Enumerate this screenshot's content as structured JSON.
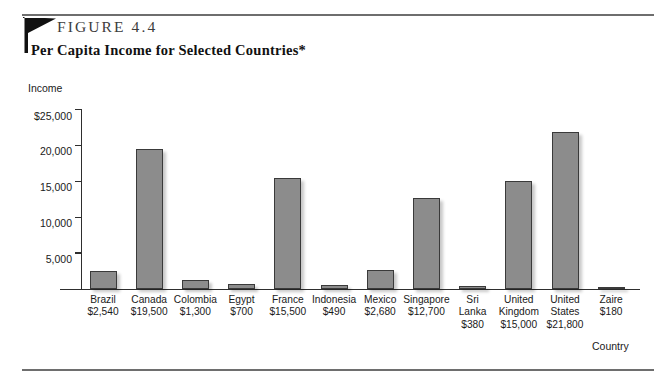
{
  "figure": {
    "label": "FIGURE 4.4",
    "title": "Per Capita Income for Selected Countries*"
  },
  "chart_data": {
    "type": "bar",
    "title": "Per Capita Income for Selected Countries*",
    "xlabel": "Country",
    "ylabel": "Income",
    "ylim": [
      0,
      25000
    ],
    "yticks": [
      0,
      5000,
      10000,
      15000,
      20000,
      25000
    ],
    "ytick_labels": [
      "",
      "5,000",
      "10,000",
      "15,000",
      "20,000",
      "$25,000"
    ],
    "grid": false,
    "legend": null,
    "categories": [
      "Brazil",
      "Canada",
      "Colombia",
      "Egypt",
      "France",
      "Indonesia",
      "Mexico",
      "Singapore",
      "Sri Lanka",
      "United Kingdom",
      "United States",
      "Zaire"
    ],
    "values": [
      2540,
      19500,
      1300,
      700,
      15500,
      490,
      2680,
      12700,
      380,
      15000,
      21800,
      180
    ],
    "value_labels": [
      "$2,540",
      "$19,500",
      "$1,300",
      "$700",
      "$15,500",
      "$490",
      "$2,680",
      "$12,700",
      "$380",
      "$15,000",
      "$21,800",
      "$180"
    ],
    "bar_color": "#8c8c8c",
    "bar_border_color": "#3a3a3a"
  }
}
